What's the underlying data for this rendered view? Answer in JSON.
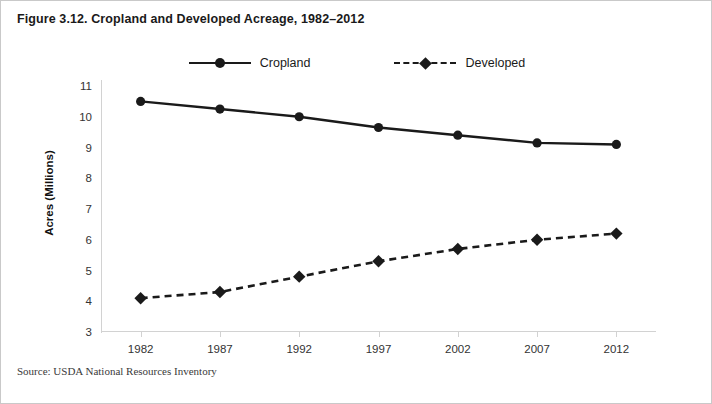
{
  "figure": {
    "title": "Figure 3.12. Cropland and Developed Acreage, 1982–2012",
    "source": "Source: USDA National Resources Inventory"
  },
  "chart_data": {
    "type": "line",
    "title": "Figure 3.12. Cropland and Developed Acreage, 1982–2012",
    "xlabel": "",
    "ylabel": "Acres (Millions)",
    "x": [
      1982,
      1987,
      1992,
      1997,
      2002,
      2007,
      2012
    ],
    "xtick_labels": [
      "1982",
      "1987",
      "1992",
      "1997",
      "2002",
      "2007",
      "2012"
    ],
    "ytick_labels": [
      "11",
      "10",
      "9",
      "8",
      "7",
      "6",
      "5",
      "4",
      "3"
    ],
    "yticks": [
      11,
      10,
      9,
      8,
      7,
      6,
      5,
      4,
      3
    ],
    "ylim": [
      3,
      11
    ],
    "grid": false,
    "legend_position": "top-center",
    "series": [
      {
        "name": "Cropland",
        "values": [
          10.5,
          10.25,
          10.0,
          9.65,
          9.4,
          9.15,
          9.1
        ],
        "line_style": "solid",
        "marker": "circle",
        "color": "#1a1a1a"
      },
      {
        "name": "Developed",
        "values": [
          4.1,
          4.3,
          4.8,
          5.3,
          5.7,
          6.0,
          6.2
        ],
        "line_style": "dashed",
        "marker": "diamond",
        "color": "#1a1a1a"
      }
    ]
  },
  "colors": {
    "ink": "#1a1a1a",
    "axis": "#d2d2d2",
    "frame": "#c9c9c9"
  }
}
